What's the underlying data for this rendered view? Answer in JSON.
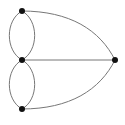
{
  "diagram": {
    "type": "multigraph",
    "width": 125,
    "height": 125,
    "background": "#ffffff",
    "edge_color": "#777777",
    "edge_width": 1,
    "node_color": "#111111",
    "node_radius": 3,
    "nodes": [
      {
        "id": "top",
        "x": 22,
        "y": 11
      },
      {
        "id": "middle",
        "x": 22,
        "y": 60
      },
      {
        "id": "bottom",
        "x": 22,
        "y": 109
      },
      {
        "id": "right",
        "x": 115,
        "y": 60
      }
    ],
    "edges": [
      {
        "id": "top-middle-left",
        "from": "top",
        "to": "middle",
        "path": "M22,11 C5,20 5,51 22,60"
      },
      {
        "id": "top-middle-right",
        "from": "top",
        "to": "middle",
        "path": "M22,11 C39,20 39,51 22,60"
      },
      {
        "id": "middle-bottom-left",
        "from": "middle",
        "to": "bottom",
        "path": "M22,60 C5,69 5,100 22,109"
      },
      {
        "id": "middle-bottom-right",
        "from": "middle",
        "to": "bottom",
        "path": "M22,60 C39,69 39,100 22,109"
      },
      {
        "id": "middle-right",
        "from": "middle",
        "to": "right",
        "path": "M22,60 L115,60"
      },
      {
        "id": "top-right",
        "from": "top",
        "to": "right",
        "path": "M22,11 C70,11 100,30 115,60"
      },
      {
        "id": "bottom-right",
        "from": "bottom",
        "to": "right",
        "path": "M22,109 C70,109 100,90 115,60"
      }
    ]
  }
}
